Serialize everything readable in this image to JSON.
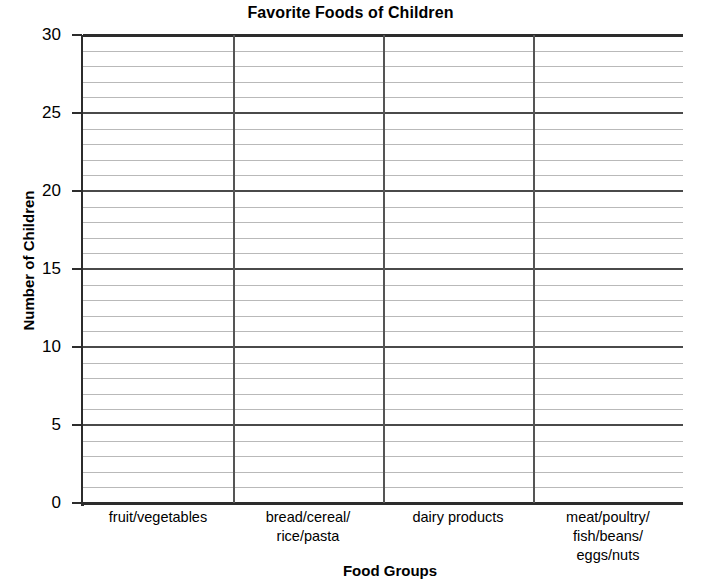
{
  "chart_data": {
    "type": "bar",
    "title": "Favorite Foods of Children",
    "xlabel": "Food Groups",
    "ylabel": "Number of Children",
    "categories": [
      "fruit/vegetables",
      "bread/cereal/\nrice/pasta",
      "dairy products",
      "meat/poultry/\nfish/beans/\neggs/nuts"
    ],
    "values": [
      null,
      null,
      null,
      null
    ],
    "ylim": [
      0,
      30
    ],
    "y_major_ticks": [
      0,
      5,
      10,
      15,
      20,
      25,
      30
    ],
    "y_tick_labels": [
      "0",
      "5",
      "10",
      "15",
      "20",
      "25",
      "30"
    ],
    "y_minor_step": 1,
    "grid": true,
    "legend": "none",
    "note": "Blank grid template — no bars plotted",
    "colors": {
      "axis": "#2c2c2c",
      "major_gridline": "#4a4a4a",
      "minor_gridline": "#b9b9b9",
      "separator": "#555555",
      "background": "#ffffff",
      "text": "#000000"
    }
  }
}
